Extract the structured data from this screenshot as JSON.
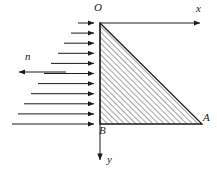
{
  "figure": {
    "background_color": "#ffffff",
    "line_color": "#1a1a1a",
    "hatch_color": "#4a4a4a",
    "labels": {
      "origin": "O",
      "x_axis": "x",
      "y_axis": "y",
      "vertex_a": "A",
      "vertex_b": "B",
      "normal_vector": "n"
    },
    "geometry": {
      "origin_point": [
        100,
        23
      ],
      "vertex_a_point": [
        202,
        124
      ],
      "vertex_b_point": [
        100,
        124
      ],
      "x_axis_end": [
        207,
        23
      ],
      "y_axis_end": [
        100,
        166
      ],
      "hatch_angle_deg": 45,
      "hatch_spacing_px": 4
    },
    "pressure_arrows": {
      "count": 11,
      "direction": "right",
      "tip_x": 100,
      "start_y": 23,
      "spacing_y": 10.1,
      "min_length": 22,
      "max_length": 88,
      "description": "linearly increasing distributed load along OB"
    },
    "normal_arrow": {
      "direction": "left",
      "x_start": 66,
      "x_end": 13,
      "y": 72
    }
  }
}
